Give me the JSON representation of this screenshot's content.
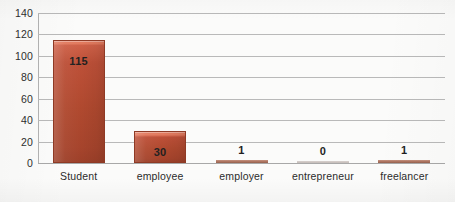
{
  "chart_data": {
    "type": "bar",
    "title": "",
    "subtitle": "",
    "xlabel": "",
    "ylabel": "",
    "categories": [
      "Student",
      "employee",
      "employer",
      "entrepreneur",
      "freelancer"
    ],
    "values": [
      115,
      30,
      1,
      0,
      1
    ],
    "value_labels": [
      "115",
      "30",
      "1",
      "0",
      "1"
    ],
    "ylim": [
      0,
      140
    ],
    "y_ticks": [
      140,
      120,
      100,
      80,
      60,
      40,
      20,
      0
    ],
    "y_tick_labels": [
      "140",
      "120",
      "100",
      "80",
      "60",
      "40",
      "20",
      "0"
    ],
    "grid": true,
    "grid_axis": "y",
    "legend": false,
    "legend_position": "none",
    "series": [
      {
        "name": "",
        "values": [
          115,
          30,
          1,
          0,
          1
        ]
      }
    ],
    "colors": {
      "bar_fill": "#b0492f",
      "bar_fill_light": "#cf6148",
      "bar_highlight": "#e27a5e",
      "bar_border": "#8f3a25",
      "gridline": "#b9b9b9",
      "axis_line": "#b2b2b2",
      "tick_text": "#2e2e2e",
      "value_text": "#1f1f1f",
      "background": "#fbfbfa"
    }
  }
}
